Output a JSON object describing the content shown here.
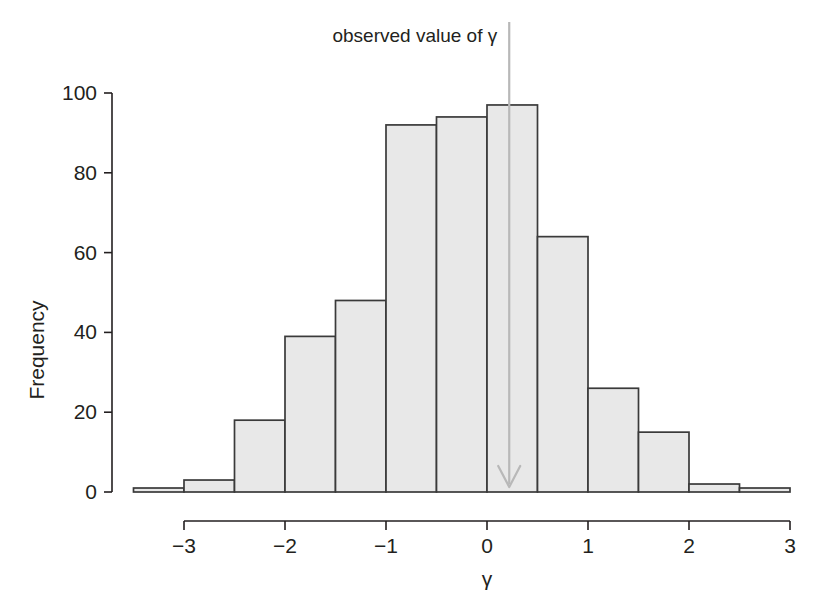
{
  "chart_data": {
    "type": "bar",
    "title": "",
    "subtitle": "",
    "xlabel": "γ",
    "ylabel": "Frequency",
    "xlim": [
      -3.6,
      3.1
    ],
    "ylim": [
      0,
      100
    ],
    "grid": false,
    "legend": null,
    "bin_width": 0.5,
    "bin_edges": [
      -3.5,
      -3.0,
      -2.5,
      -2.0,
      -1.5,
      -1.0,
      -0.5,
      0.0,
      0.5,
      1.0,
      1.5,
      2.0,
      2.5,
      3.0
    ],
    "bin_centers": [
      -3.25,
      -2.75,
      -2.25,
      -1.75,
      -1.25,
      -0.75,
      -0.25,
      0.25,
      0.75,
      1.25,
      1.75,
      2.25,
      2.75
    ],
    "categories": [
      "-3.5 to -3.0",
      "-3.0 to -2.5",
      "-2.5 to -2.0",
      "-2.0 to -1.5",
      "-1.5 to -1.0",
      "-1.0 to -0.5",
      "-0.5 to 0.0",
      "0.0 to 0.5",
      "0.5 to 1.0",
      "1.0 to 1.5",
      "1.5 to 2.0",
      "2.0 to 2.5",
      "2.5 to 3.0"
    ],
    "values": [
      1,
      3,
      18,
      39,
      48,
      92,
      94,
      97,
      64,
      26,
      15,
      2,
      1
    ],
    "xticks": [
      -3,
      -2,
      -1,
      0,
      1,
      2,
      3
    ],
    "xtick_labels": [
      "−3",
      "−2",
      "−1",
      "0",
      "1",
      "2",
      "3"
    ],
    "yticks": [
      0,
      20,
      40,
      60,
      80,
      100
    ],
    "ytick_labels": [
      "0",
      "20",
      "40",
      "60",
      "80",
      "100"
    ],
    "annotations": [
      {
        "name": "observed-value-marker",
        "label": "observed value of γ",
        "x": 0.22,
        "y_top": 100,
        "style": "downward-arrow",
        "color": "#b8b8b8"
      }
    ],
    "colors": {
      "bar_fill": "#e8e8e8",
      "bar_edge": "#3a3a3a",
      "axis": "#231f20",
      "annotation": "#b8b8b8",
      "background": "#ffffff"
    }
  },
  "figure": {
    "annotation_label": "observed value of γ",
    "y_axis_title": "Frequency",
    "x_axis_title": "γ"
  }
}
